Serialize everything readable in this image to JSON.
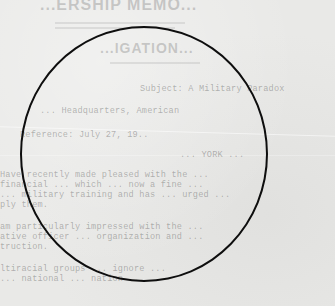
{
  "document": {
    "heading": "...ERSHIP MEMO...",
    "subheading": "...IGATION...",
    "lines": [
      {
        "text": "Subject:  A Military Paradox",
        "x": 140,
        "y": 84
      },
      {
        "text": "...        Headquarters, American",
        "x": 40,
        "y": 106
      },
      {
        "text": "Reference: July 27, 19..",
        "x": 20,
        "y": 130
      },
      {
        "text": "          ... YORK ...",
        "x": 180,
        "y": 150
      },
      {
        "text": "Have recently made pleased with the ...",
        "x": 0,
        "y": 170
      },
      {
        "text": "financial ... which ... now a fine ...",
        "x": 0,
        "y": 180
      },
      {
        "text": "... military training and has ... urged ...",
        "x": 0,
        "y": 190
      },
      {
        "text": "ply them.",
        "x": 0,
        "y": 200
      },
      {
        "text": "am particularly impressed with the ...",
        "x": 0,
        "y": 222
      },
      {
        "text": "ative officer ... organization and ...",
        "x": 0,
        "y": 232
      },
      {
        "text": "truction.",
        "x": 0,
        "y": 242
      },
      {
        "text": "ltiracial  groups ... ignore ...",
        "x": 0,
        "y": 264
      },
      {
        "text": "  ... national ... nation ... ",
        "x": 0,
        "y": 274
      }
    ]
  },
  "annotation": {
    "shape": "circle",
    "stroke_color": "#0e0e0e"
  }
}
